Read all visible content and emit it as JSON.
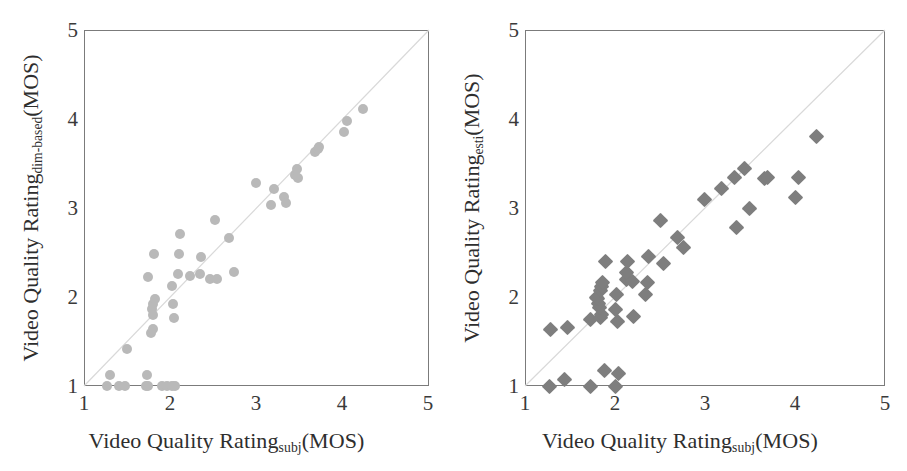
{
  "figure": {
    "background": "#ffffff",
    "marker_color_left": "#b9b9b9",
    "marker_color_right": "#7e7e7e",
    "frame_color": "#7b7b7b",
    "diagonal_color": "#d9d9d9"
  },
  "panels": [
    {
      "id": "left",
      "xlabel_main": "Video Quality Rating",
      "xlabel_sub": "subj",
      "xlabel_tail": "(MOS)",
      "ylabel_main": "Video Quality Rating",
      "ylabel_sub": "dim-based",
      "ylabel_tail": "(MOS)",
      "xticks": [
        "1",
        "2",
        "3",
        "4",
        "5"
      ],
      "yticks": [
        "5",
        "4",
        "3",
        "2",
        "1"
      ],
      "marker": "circle"
    },
    {
      "id": "right",
      "xlabel_main": "Video Quality Rating",
      "xlabel_sub": "subj",
      "xlabel_tail": "(MOS)",
      "ylabel_main": "Video Quality Rating",
      "ylabel_sub": "esti",
      "ylabel_tail": "(MOS)",
      "xticks": [
        "1",
        "2",
        "3",
        "4",
        "5"
      ],
      "yticks": [
        "5",
        "4",
        "3",
        "2",
        "1"
      ],
      "marker": "diamond"
    }
  ],
  "chart_data": [
    {
      "type": "scatter",
      "title": "",
      "xlabel": "Video Quality Rating_subj (MOS)",
      "ylabel": "Video Quality Rating_dim-based (MOS)",
      "xlim": [
        1,
        5
      ],
      "ylim": [
        1,
        5
      ],
      "xticks": [
        1,
        2,
        3,
        4,
        5
      ],
      "yticks": [
        1,
        2,
        3,
        4,
        5
      ],
      "grid": false,
      "legend": "none",
      "reference_line": {
        "type": "identity",
        "from": [
          1,
          1
        ],
        "to": [
          5,
          5
        ]
      },
      "marker_style": "circle",
      "marker_color": "#b9b9b9",
      "points": [
        [
          1.27,
          1.0
        ],
        [
          1.3,
          1.12
        ],
        [
          1.41,
          1.0
        ],
        [
          1.48,
          1.0
        ],
        [
          1.5,
          1.42
        ],
        [
          1.72,
          1.0
        ],
        [
          1.74,
          1.0
        ],
        [
          1.73,
          1.12
        ],
        [
          1.9,
          1.0
        ],
        [
          1.96,
          1.0
        ],
        [
          2.02,
          1.0
        ],
        [
          2.06,
          1.0
        ],
        [
          1.78,
          1.6
        ],
        [
          1.8,
          1.64
        ],
        [
          1.8,
          1.8
        ],
        [
          1.79,
          1.86
        ],
        [
          1.8,
          1.92
        ],
        [
          1.82,
          1.98
        ],
        [
          2.04,
          1.76
        ],
        [
          2.03,
          1.92
        ],
        [
          2.02,
          2.12
        ],
        [
          1.74,
          2.22
        ],
        [
          1.81,
          2.48
        ],
        [
          2.09,
          2.26
        ],
        [
          2.1,
          2.48
        ],
        [
          2.11,
          2.71
        ],
        [
          2.23,
          2.24
        ],
        [
          2.34,
          2.26
        ],
        [
          2.36,
          2.45
        ],
        [
          2.46,
          2.2
        ],
        [
          2.54,
          2.2
        ],
        [
          2.52,
          2.86
        ],
        [
          2.68,
          2.66
        ],
        [
          2.74,
          2.28
        ],
        [
          2.99,
          3.28
        ],
        [
          3.17,
          3.03
        ],
        [
          3.2,
          3.21
        ],
        [
          3.32,
          3.12
        ],
        [
          3.34,
          3.06
        ],
        [
          3.45,
          3.37
        ],
        [
          3.48,
          3.34
        ],
        [
          3.47,
          3.44
        ],
        [
          3.68,
          3.63
        ],
        [
          3.71,
          3.66
        ],
        [
          3.72,
          3.68
        ],
        [
          4.01,
          3.85
        ],
        [
          4.05,
          3.98
        ],
        [
          4.24,
          4.11
        ]
      ]
    },
    {
      "type": "scatter",
      "title": "",
      "xlabel": "Video Quality Rating_subj (MOS)",
      "ylabel": "Video Quality Rating_esti (MOS)",
      "xlim": [
        1,
        5
      ],
      "ylim": [
        1,
        5
      ],
      "xticks": [
        1,
        2,
        3,
        4,
        5
      ],
      "yticks": [
        1,
        2,
        3,
        4,
        5
      ],
      "grid": false,
      "legend": "none",
      "reference_line": {
        "type": "identity",
        "from": [
          1,
          1
        ],
        "to": [
          5,
          5
        ]
      },
      "marker_style": "diamond",
      "marker_color": "#7e7e7e",
      "points": [
        [
          1.27,
          1.0
        ],
        [
          1.44,
          1.07
        ],
        [
          1.73,
          1.0
        ],
        [
          1.88,
          1.17
        ],
        [
          2.01,
          1.0
        ],
        [
          2.04,
          1.14
        ],
        [
          1.28,
          1.64
        ],
        [
          1.47,
          1.66
        ],
        [
          1.73,
          1.75
        ],
        [
          1.84,
          1.77
        ],
        [
          1.85,
          1.8
        ],
        [
          1.83,
          1.88
        ],
        [
          1.82,
          1.93
        ],
        [
          1.8,
          1.98
        ],
        [
          1.79,
          2.0
        ],
        [
          1.84,
          2.07
        ],
        [
          1.85,
          2.12
        ],
        [
          1.86,
          2.16
        ],
        [
          1.89,
          2.4
        ],
        [
          2.02,
          2.03
        ],
        [
          2.01,
          1.86
        ],
        [
          2.03,
          1.72
        ],
        [
          2.13,
          2.2
        ],
        [
          2.13,
          2.28
        ],
        [
          2.14,
          2.4
        ],
        [
          2.19,
          2.17
        ],
        [
          2.21,
          1.78
        ],
        [
          2.34,
          2.03
        ],
        [
          2.36,
          2.16
        ],
        [
          2.37,
          2.45
        ],
        [
          2.5,
          2.86
        ],
        [
          2.54,
          2.38
        ],
        [
          2.69,
          2.67
        ],
        [
          2.76,
          2.56
        ],
        [
          2.99,
          3.1
        ],
        [
          3.18,
          3.22
        ],
        [
          3.33,
          3.34
        ],
        [
          3.35,
          2.78
        ],
        [
          3.44,
          3.44
        ],
        [
          3.49,
          3.0
        ],
        [
          3.66,
          3.33
        ],
        [
          3.69,
          3.34
        ],
        [
          4.0,
          3.12
        ],
        [
          4.04,
          3.34
        ],
        [
          4.24,
          3.8
        ]
      ]
    }
  ]
}
